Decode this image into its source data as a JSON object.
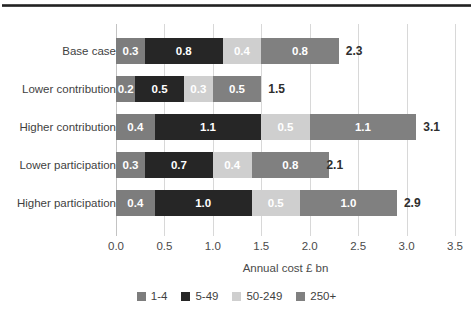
{
  "chart_data": {
    "type": "bar",
    "orientation": "horizontal",
    "stacked": true,
    "title": "",
    "xlabel": "Annual cost £ bn",
    "ylabel": "",
    "xlim": [
      0.0,
      3.5
    ],
    "xticks": [
      "0.0",
      "0.5",
      "1.0",
      "1.5",
      "2.0",
      "2.5",
      "3.0",
      "3.5"
    ],
    "grid": "vertical",
    "legend_position": "bottom",
    "categories": [
      "Base case",
      "Lower contribution",
      "Higher contribution",
      "Lower participation",
      "Higher participation"
    ],
    "series": [
      {
        "name": "1-4",
        "color": "#7d7d7d",
        "values": [
          0.3,
          0.2,
          0.4,
          0.3,
          0.4
        ]
      },
      {
        "name": "5-49",
        "color": "#262626",
        "values": [
          0.8,
          0.5,
          1.1,
          0.7,
          1.0
        ]
      },
      {
        "name": "50-249",
        "color": "#cfcfcf",
        "values": [
          0.4,
          0.3,
          0.5,
          0.4,
          0.5
        ]
      },
      {
        "name": "250+",
        "color": "#808080",
        "values": [
          0.8,
          0.5,
          1.1,
          0.8,
          1.0
        ]
      }
    ],
    "segment_labels": [
      [
        "0.3",
        "0.8",
        "0.4",
        "0.8"
      ],
      [
        "0.2",
        "0.5",
        "0.3",
        "0.5"
      ],
      [
        "0.4",
        "1.1",
        "0.5",
        "1.1"
      ],
      [
        "0.3",
        "0.7",
        "0.4",
        "0.8"
      ],
      [
        "0.4",
        "1.0",
        "0.5",
        "1.0"
      ]
    ],
    "totals": [
      "2.3",
      "1.5",
      "3.1",
      "2.1",
      "2.9"
    ],
    "total_values": [
      2.3,
      1.5,
      3.1,
      2.1,
      2.9
    ]
  },
  "legend": {
    "items": [
      {
        "label": "1-4"
      },
      {
        "label": "5-49"
      },
      {
        "label": "50-249"
      },
      {
        "label": "250+"
      }
    ]
  }
}
